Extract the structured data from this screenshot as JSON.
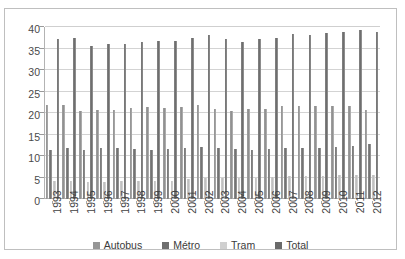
{
  "top_sliver_text": "",
  "legend": {
    "position": "bottom",
    "items": [
      {
        "label": "Autobus",
        "key": "autobus",
        "swatch": "#969696",
        "icon": "legend-swatch-icon"
      },
      {
        "label": "Métro",
        "key": "metro",
        "swatch": "#6e6e6e",
        "icon": "legend-swatch-icon"
      },
      {
        "label": "Tram",
        "key": "tram",
        "swatch": "#d0d0d0",
        "icon": "legend-swatch-icon"
      },
      {
        "label": "Total",
        "key": "total",
        "swatch": "#6a6a6a",
        "icon": "legend-swatch-icon"
      }
    ]
  },
  "axis": {
    "y_ticks": [
      40,
      35,
      30,
      25,
      20,
      15,
      10,
      5,
      0
    ],
    "x_ticks": [
      "1993",
      "1994",
      "1995",
      "1996",
      "1997",
      "1998",
      "1999",
      "2000",
      "2001",
      "2002",
      "2003",
      "2004",
      "2005",
      "2006",
      "2007",
      "2008",
      "2009",
      "2010",
      "2011",
      "2012"
    ]
  },
  "chart_data": {
    "type": "bar",
    "title": "",
    "subtitle": "",
    "xlabel": "",
    "ylabel": "",
    "ylim": [
      0,
      40
    ],
    "ytick_step": 5,
    "grid": true,
    "legend_position": "bottom",
    "categories": [
      "1993",
      "1994",
      "1995",
      "1996",
      "1997",
      "1998",
      "1999",
      "2000",
      "2001",
      "2002",
      "2003",
      "2004",
      "2005",
      "2006",
      "2007",
      "2008",
      "2009",
      "2010",
      "2011",
      "2012"
    ],
    "series": [
      {
        "name": "Autobus",
        "color": "#969696",
        "values": [
          21.8,
          21.8,
          20.4,
          20.8,
          20.8,
          21.2,
          21.3,
          21.2,
          21.4,
          21.8,
          21.0,
          20.4,
          21.0,
          21.0,
          21.7,
          21.6,
          21.6,
          21.7,
          21.7,
          20.8
        ]
      },
      {
        "name": "Métro",
        "color": "#6e6e6e",
        "values": [
          11.5,
          11.9,
          11.5,
          11.8,
          11.8,
          11.7,
          11.5,
          11.7,
          11.9,
          12.1,
          11.8,
          11.6,
          11.5,
          11.7,
          11.9,
          11.8,
          11.8,
          12.0,
          12.3,
          12.8
        ]
      },
      {
        "name": "Tram",
        "color": "#d0d0d0",
        "values": [
          4.2,
          4.3,
          4.0,
          4.0,
          4.1,
          4.2,
          4.3,
          4.3,
          4.6,
          4.9,
          4.9,
          5.0,
          4.9,
          5.2,
          5.3,
          5.3,
          5.4,
          5.5,
          5.5,
          5.5
        ]
      },
      {
        "name": "Total",
        "color": "#6a6a6a",
        "values": [
          37.2,
          37.5,
          35.5,
          36.0,
          36.0,
          36.6,
          36.7,
          36.8,
          37.5,
          38.2,
          37.2,
          36.6,
          37.1,
          37.5,
          38.4,
          38.2,
          38.5,
          38.9,
          39.2,
          38.8
        ]
      }
    ]
  }
}
